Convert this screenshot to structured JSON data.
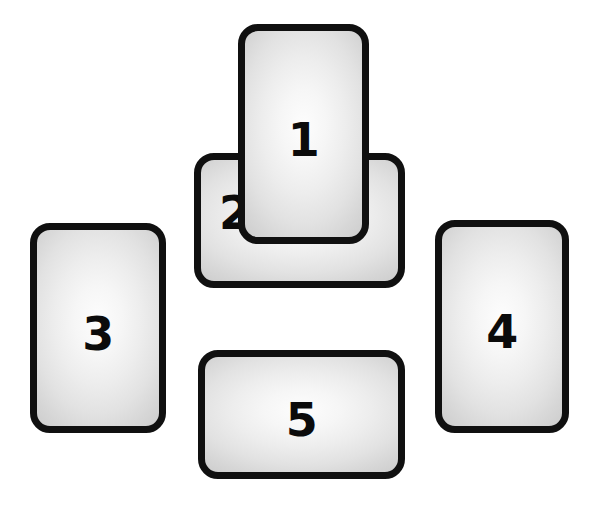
{
  "canvas": {
    "width": 594,
    "height": 520,
    "background_color": "#ffffff",
    "description": "Five blank rounded-rectangle cards arranged in a cross/plus pattern, each labeled with a bold black numeral"
  },
  "style": {
    "card_outline_color": "#101010",
    "card_face_color": "#ededed",
    "numeral_color": "#0b0b0b",
    "corner_radius_px": 20,
    "outline_width_px": 7
  },
  "cards": [
    {
      "id": "card-1",
      "label": "1",
      "orientation": "portrait",
      "x": 238,
      "y": 24,
      "width": 131,
      "height": 220,
      "z_order": 2,
      "label_position": "center",
      "overlaps": "card-2"
    },
    {
      "id": "card-2",
      "label": "2",
      "orientation": "landscape",
      "x": 194,
      "y": 153,
      "width": 211,
      "height": 135,
      "z_order": 1,
      "label_position": "left",
      "overlapped_by": "card-1"
    },
    {
      "id": "card-3",
      "label": "3",
      "orientation": "portrait",
      "x": 30,
      "y": 223,
      "width": 136,
      "height": 210,
      "z_order": 1,
      "label_position": "center",
      "overlaps": ""
    },
    {
      "id": "card-4",
      "label": "4",
      "orientation": "portrait",
      "x": 435,
      "y": 220,
      "width": 134,
      "height": 213,
      "z_order": 1,
      "label_position": "center",
      "overlaps": ""
    },
    {
      "id": "card-5",
      "label": "5",
      "orientation": "landscape",
      "x": 198,
      "y": 350,
      "width": 207,
      "height": 129,
      "z_order": 1,
      "label_position": "center",
      "overlaps": ""
    }
  ]
}
